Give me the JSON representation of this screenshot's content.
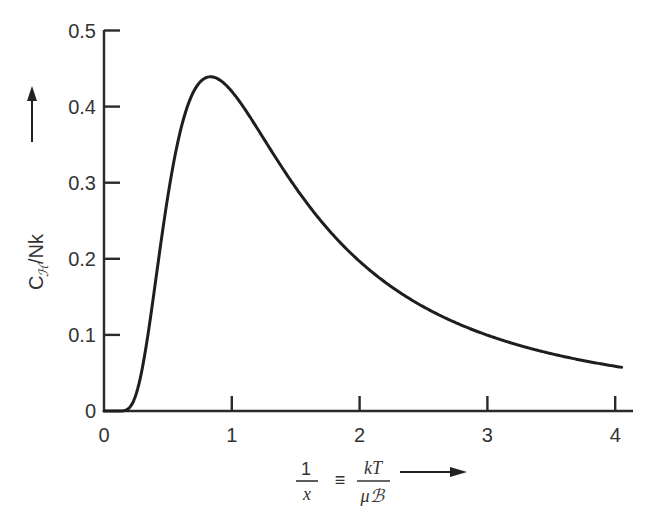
{
  "chart_data": {
    "type": "line",
    "title": "",
    "xlabel": "1/x ≡ kT/μℬ",
    "xlabel_parts": {
      "lhs_num": "1",
      "lhs_den": "x",
      "equiv": "≡",
      "rhs_num": "kT",
      "rhs_den": "μℬ",
      "arrow": "→"
    },
    "ylabel": "Cℋ/Nk",
    "ylabel_parts": {
      "main": "C",
      "subscript": "ℋ",
      "rest": "/Nk",
      "arrow": "→"
    },
    "xlim": [
      0,
      4.15
    ],
    "ylim": [
      0,
      0.5
    ],
    "xticks": [
      0,
      1,
      2,
      3,
      4
    ],
    "xtick_labels": [
      "0",
      "1",
      "2",
      "3",
      "4"
    ],
    "yticks": [
      0,
      0.1,
      0.2,
      0.3,
      0.4,
      0.5
    ],
    "ytick_labels": [
      "0",
      "0.1",
      "0.2",
      "0.3",
      "0.4",
      "0.5"
    ],
    "grid": false,
    "legend": "none",
    "series": [
      {
        "name": "Schottky heat capacity x² sech² x",
        "x": [
          0.0,
          0.1,
          0.15,
          0.2,
          0.25,
          0.3,
          0.35,
          0.4,
          0.45,
          0.5,
          0.55,
          0.6,
          0.65,
          0.7,
          0.75,
          0.8,
          0.85,
          0.9,
          0.95,
          1.0,
          1.1,
          1.2,
          1.3,
          1.4,
          1.5,
          1.6,
          1.8,
          2.0,
          2.2,
          2.4,
          2.6,
          2.8,
          3.0,
          3.2,
          3.4,
          3.6,
          3.8,
          4.0,
          4.05
        ],
        "y": [
          0.0,
          0.0,
          0.0001,
          0.0018,
          0.0108,
          0.0318,
          0.0638,
          0.1037,
          0.1469,
          0.1938,
          0.2403,
          0.2822,
          0.322,
          0.357,
          0.3855,
          0.4069,
          0.4218,
          0.4315,
          0.4367,
          0.42,
          0.4037,
          0.384,
          0.3614,
          0.3376,
          0.3133,
          0.2897,
          0.2479,
          0.2129,
          0.1833,
          0.1588,
          0.1383,
          0.1212,
          0.1068,
          0.0947,
          0.0844,
          0.0757,
          0.0682,
          0.0615,
          0.0601
        ]
      }
    ]
  }
}
